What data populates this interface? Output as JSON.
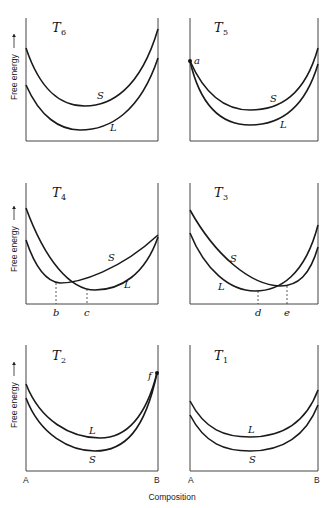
{
  "figure": {
    "x_axis_label": "Composition",
    "y_axis_label": "Free energy",
    "y_axis_arrow": "up-arrow",
    "end_labels": {
      "left": "A",
      "right": "B"
    }
  },
  "panels": [
    {
      "id": "T6",
      "temp_main": "T",
      "temp_sub": "6",
      "curves": [
        {
          "name": "S",
          "label": "S"
        },
        {
          "name": "L",
          "label": "L"
        }
      ],
      "points": [],
      "markers": []
    },
    {
      "id": "T5",
      "temp_main": "T",
      "temp_sub": "5",
      "curves": [
        {
          "name": "S",
          "label": "S"
        },
        {
          "name": "L",
          "label": "L"
        }
      ],
      "points": [
        {
          "label": "a"
        }
      ],
      "markers": []
    },
    {
      "id": "T4",
      "temp_main": "T",
      "temp_sub": "4",
      "curves": [
        {
          "name": "S",
          "label": "S"
        },
        {
          "name": "L",
          "label": "L"
        }
      ],
      "points": [],
      "markers": [
        {
          "label": "b"
        },
        {
          "label": "c"
        }
      ]
    },
    {
      "id": "T3",
      "temp_main": "T",
      "temp_sub": "3",
      "curves": [
        {
          "name": "S",
          "label": "S"
        },
        {
          "name": "L",
          "label": "L"
        }
      ],
      "points": [],
      "markers": [
        {
          "label": "d"
        },
        {
          "label": "e"
        }
      ]
    },
    {
      "id": "T2",
      "temp_main": "T",
      "temp_sub": "2",
      "curves": [
        {
          "name": "L",
          "label": "L"
        },
        {
          "name": "S",
          "label": "S"
        }
      ],
      "points": [
        {
          "label": "f"
        }
      ],
      "markers": []
    },
    {
      "id": "T1",
      "temp_main": "T",
      "temp_sub": "1",
      "curves": [
        {
          "name": "L",
          "label": "L"
        },
        {
          "name": "S",
          "label": "S"
        }
      ],
      "points": [],
      "markers": []
    }
  ],
  "colors": {
    "line": "#1a1a1a",
    "frame": "#444444",
    "background": "#ffffff"
  }
}
